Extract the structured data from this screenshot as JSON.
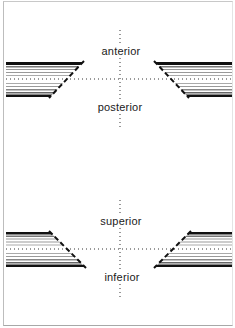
{
  "diagram": {
    "title": "",
    "panels": [
      {
        "id": "sagittal-top",
        "labels": {
          "upper": "anterior",
          "lower": "posterior"
        },
        "left_shape_edge": "slopes down-left",
        "right_shape_edge": "slopes down-right"
      },
      {
        "id": "coronal-bottom",
        "labels": {
          "upper": "superior",
          "lower": "inferior"
        },
        "left_shape_edge": "slopes down-right",
        "right_shape_edge": "slopes down-left"
      }
    ],
    "colors": {
      "background": "#ffffff",
      "ink": "#1a1a1a",
      "stripe_dark": "#111111",
      "stripe_mid": "#6a6a6a",
      "stripe_light": "#9a9a9a",
      "frame": "#bdbdbd"
    }
  }
}
